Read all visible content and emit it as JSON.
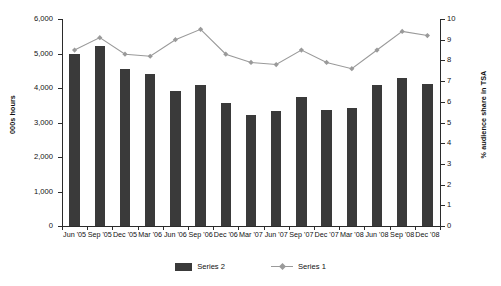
{
  "chart_data": {
    "type": "bar",
    "title": "",
    "subtitle": "",
    "xlabel": "",
    "ylabel": "000s hours",
    "y2label": "% audience share in TSA",
    "ylim": [
      0,
      6000
    ],
    "y2lim": [
      0,
      10
    ],
    "grid": false,
    "legend_position": "bottom",
    "categories": [
      "Jun '05",
      "Sep '05",
      "Dec '05",
      "Mar '06",
      "Jun '06",
      "Sep '06",
      "Dec '06",
      "Mar '07",
      "Jun '07",
      "Sep '07",
      "Dec '07",
      "Mar '08",
      "Jun '08",
      "Sep '08",
      "Dec '08"
    ],
    "y_ticks": [
      "0",
      "1,000",
      "2,000",
      "3,000",
      "4,000",
      "5,000",
      "6,000"
    ],
    "y_tick_values": [
      0,
      1000,
      2000,
      3000,
      4000,
      5000,
      6000
    ],
    "y2_ticks": [
      "0",
      "1",
      "2",
      "3",
      "4",
      "5",
      "6",
      "7",
      "8",
      "9",
      "10"
    ],
    "y2_tick_values": [
      0,
      1,
      2,
      3,
      4,
      5,
      6,
      7,
      8,
      9,
      10
    ],
    "series": [
      {
        "name": "Series 2",
        "type": "bar",
        "axis": "left",
        "color": "#3a3a3a",
        "values": [
          5000,
          5220,
          4550,
          4400,
          3920,
          4080,
          3570,
          3230,
          3330,
          3740,
          3370,
          3410,
          4080,
          4300,
          4110
        ]
      },
      {
        "name": "Series 1",
        "type": "line",
        "axis": "right",
        "color": "#9a9a9a",
        "values": [
          8.5,
          9.1,
          8.3,
          8.2,
          9.0,
          9.5,
          8.3,
          7.9,
          7.8,
          8.5,
          7.9,
          7.6,
          8.5,
          9.4,
          9.2
        ]
      }
    ],
    "legend": [
      {
        "label": "Series 2",
        "marker": "bar-swatch",
        "color": "#3a3a3a"
      },
      {
        "label": "Series 1",
        "marker": "line-diamond",
        "color": "#9a9a9a"
      }
    ]
  }
}
